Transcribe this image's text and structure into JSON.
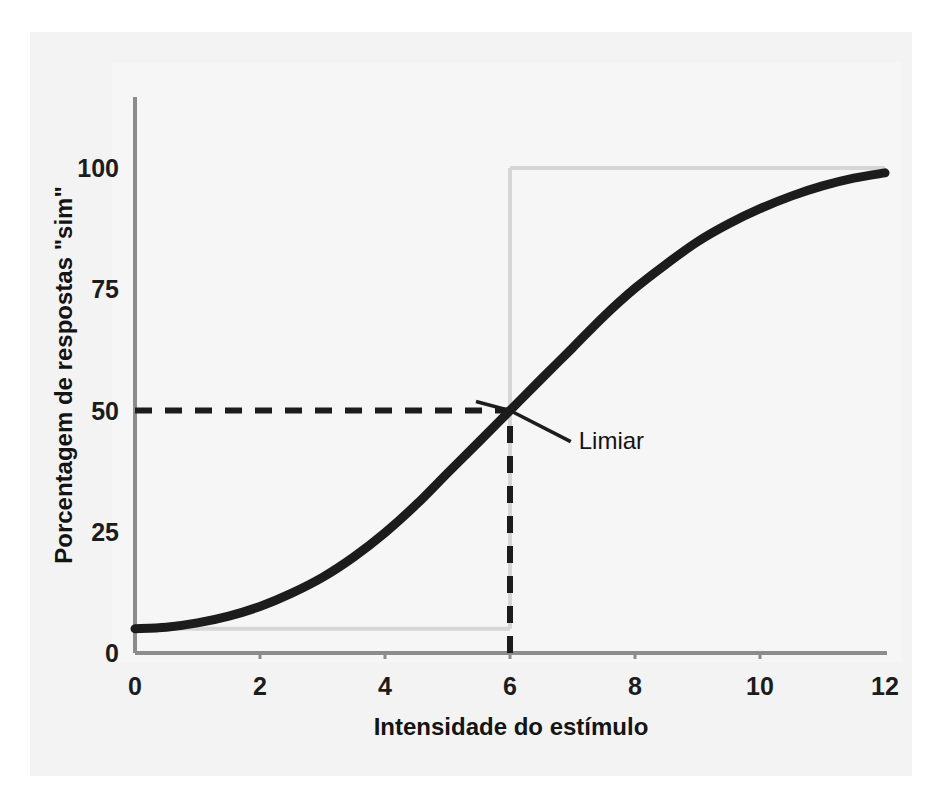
{
  "figure": {
    "background_color": "#ffffff",
    "panel_color": "#ececec",
    "plot_bg_color": "#f7f7f7"
  },
  "chart_data": {
    "type": "line",
    "title": "",
    "subtitle": "",
    "xlabel": "Intensidade do estímulo",
    "ylabel": "Porcentagem de respostas \"sim\"",
    "xlim": [
      0,
      12
    ],
    "ylim": [
      0,
      108
    ],
    "xticks": [
      0,
      2,
      4,
      6,
      8,
      10,
      12
    ],
    "xtick_labels": [
      "0",
      "2",
      "4",
      "6",
      "8",
      "10",
      "12"
    ],
    "yticks": [
      0,
      25,
      50,
      75,
      100
    ],
    "ytick_labels": [
      "0",
      "25",
      "50",
      "75",
      "100"
    ],
    "grid": false,
    "legend": null,
    "legend_position": "none",
    "series": [
      {
        "name": "Função psicométrica",
        "color": "#1c1c1c",
        "linewidth": 9,
        "x": [
          0,
          0.5,
          1,
          1.5,
          2,
          2.5,
          3,
          3.5,
          4,
          4.5,
          5,
          5.5,
          6,
          6.5,
          7,
          7.5,
          8,
          8.5,
          9,
          9.5,
          10,
          10.5,
          11,
          11.5,
          12
        ],
        "values": [
          5,
          5.3,
          6.2,
          7.6,
          9.6,
          12.3,
          15.6,
          19.8,
          24.8,
          30.6,
          37.1,
          43.5,
          50.0,
          56.5,
          62.9,
          69.4,
          75.2,
          80.2,
          84.8,
          88.5,
          91.6,
          94.2,
          96.3,
          97.9,
          99.0
        ]
      }
    ],
    "reference_lines": [
      {
        "name": "threshold-horizontal",
        "orientation": "horizontal",
        "value": 50,
        "from_x": 0,
        "to_x": 6,
        "style": "dashed",
        "color": "#1c1c1c"
      },
      {
        "name": "threshold-vertical",
        "orientation": "vertical",
        "value": 6,
        "from_y": 0,
        "to_y": 50,
        "style": "dashed",
        "color": "#1c1c1c"
      },
      {
        "name": "asymptote-lower-guide",
        "orientation": "horizontal",
        "value": 5,
        "from_x": 0,
        "to_x": 6,
        "style": "solid",
        "color": "#d6d6d6"
      },
      {
        "name": "asymptote-upper-guide",
        "orientation": "horizontal",
        "value": 100,
        "from_x": 6,
        "to_x": 12,
        "style": "solid",
        "color": "#d6d6d6"
      },
      {
        "name": "upper-guide-vertical",
        "orientation": "vertical",
        "value": 6,
        "from_y": 5,
        "to_y": 100,
        "style": "solid",
        "color": "#d6d6d6"
      }
    ],
    "annotations": [
      {
        "name": "limiar",
        "text": "Limiar",
        "point_x": 6,
        "point_y": 50,
        "label_x": 7.1,
        "label_y": 44,
        "leader": true
      }
    ]
  }
}
